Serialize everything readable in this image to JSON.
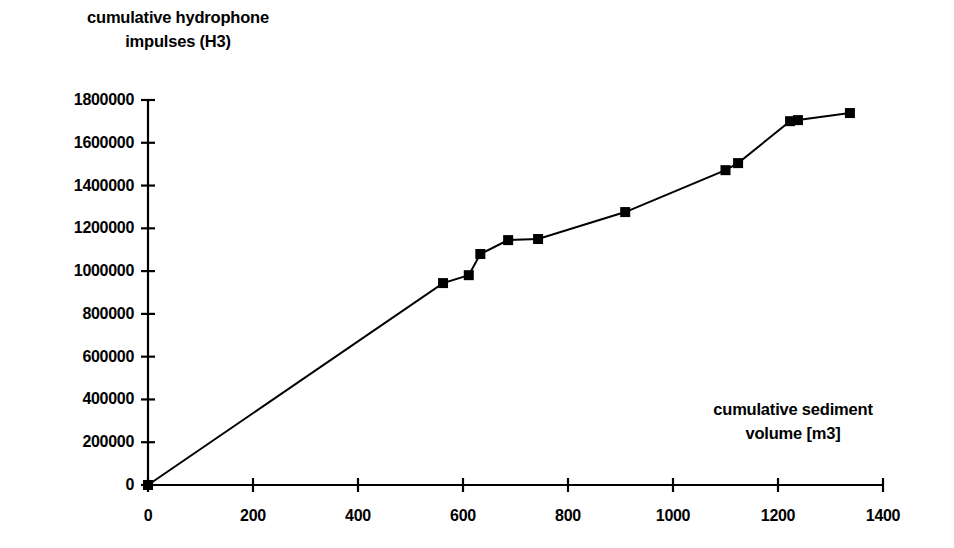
{
  "chart_data": {
    "type": "line",
    "title": "",
    "ylabel": "cumulative hydrophone\nimpulses (H3)",
    "ylabel_line1": "cumulative hydrophone",
    "ylabel_line2": "impulses (H3)",
    "xlabel": "cumulative sediment\nvolume [m3]",
    "xlabel_line1": "cumulative sediment",
    "xlabel_line2": "volume [m3]",
    "xlim": [
      0,
      1400
    ],
    "ylim": [
      0,
      1800000
    ],
    "xticks": [
      0,
      200,
      400,
      600,
      800,
      1000,
      1200,
      1400
    ],
    "xtick_labels": [
      "0",
      "200",
      "400",
      "600",
      "800",
      "1000",
      "1200",
      "1400"
    ],
    "yticks": [
      0,
      200000,
      400000,
      600000,
      800000,
      1000000,
      1200000,
      1400000,
      1600000,
      1800000
    ],
    "ytick_labels": [
      "0",
      "200000",
      "400000",
      "600000",
      "800000",
      "1000000",
      "1200000",
      "1400000",
      "1600000",
      "1800000"
    ],
    "grid": false,
    "legend": null,
    "legend_position": "none",
    "marker": "filled-square",
    "line_color": "#000000",
    "marker_color": "#000000",
    "x": [
      0,
      562,
      611,
      633,
      686,
      743,
      909,
      1100,
      1124,
      1223,
      1238,
      1337
    ],
    "y": [
      0,
      944000,
      981000,
      1080000,
      1145000,
      1150000,
      1276000,
      1472000,
      1505000,
      1701000,
      1706000,
      1739000
    ],
    "series": [
      {
        "name": "cumulative hydrophone impulses (H3)",
        "points": [
          {
            "x": 0,
            "y": 0
          },
          {
            "x": 562,
            "y": 944000
          },
          {
            "x": 611,
            "y": 981000
          },
          {
            "x": 633,
            "y": 1080000
          },
          {
            "x": 686,
            "y": 1145000
          },
          {
            "x": 743,
            "y": 1150000
          },
          {
            "x": 909,
            "y": 1276000
          },
          {
            "x": 1100,
            "y": 1472000
          },
          {
            "x": 1124,
            "y": 1505000
          },
          {
            "x": 1223,
            "y": 1701000
          },
          {
            "x": 1238,
            "y": 1706000
          },
          {
            "x": 1337,
            "y": 1739000
          }
        ]
      }
    ]
  },
  "axes": {
    "y_axis_name": "y-axis",
    "x_axis_name": "x-axis"
  },
  "colors": {
    "background": "#ffffff",
    "foreground": "#000000"
  }
}
